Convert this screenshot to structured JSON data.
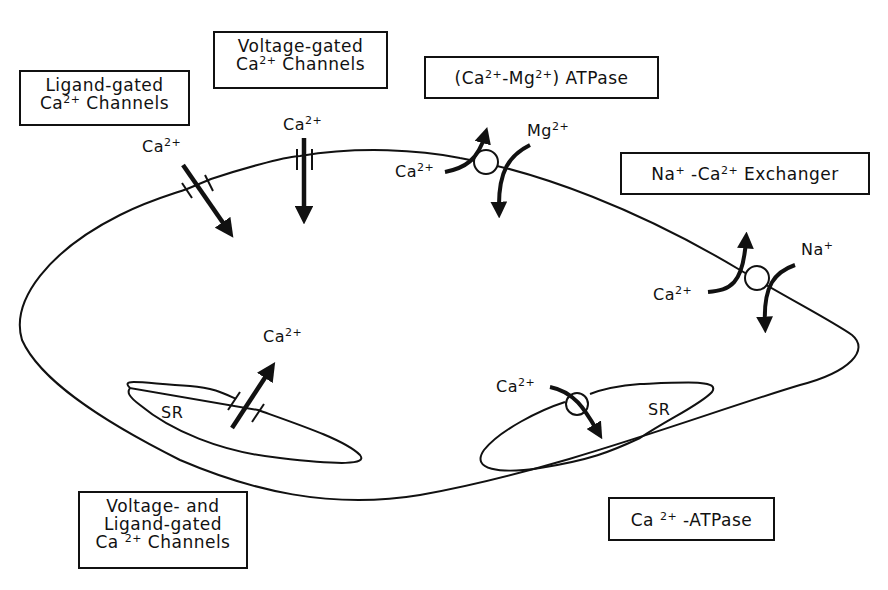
{
  "diagram": {
    "colors": {
      "stroke": "#111111",
      "background": "#ffffff"
    },
    "compartments": {
      "cell": {
        "name": "cell-membrane"
      },
      "sr_left": {
        "label": "SR"
      },
      "sr_right": {
        "label": "SR"
      }
    },
    "labels": {
      "ligand_gated": {
        "line1": "Ligand-gated",
        "line2_base": "Ca",
        "line2_sup": "2+",
        "line2_rest": " Channels"
      },
      "voltage_gated": {
        "line1": "Voltage-gated",
        "line2_base": "Ca",
        "line2_sup": "2+",
        "line2_rest": " Channels"
      },
      "ca_mg_atpase": {
        "open": "(Ca",
        "sup1": "2+",
        "mid": "-Mg",
        "sup2": "2+",
        "close": ")  ATPase"
      },
      "na_ca_exchanger": {
        "na": "Na",
        "sup1": "+",
        "mid": " -Ca",
        "sup2": "2+",
        "rest": "  Exchanger"
      },
      "voltage_ligand": {
        "line1": "Voltage-  and",
        "line2": "Ligand-gated",
        "line3_base": "Ca ",
        "line3_sup": "2+",
        "line3_rest": " Channels"
      },
      "ca_atpase": {
        "base": "Ca ",
        "sup": "2+",
        "rest": " -ATPase"
      }
    },
    "ions": {
      "ligand_ca": {
        "base": "Ca",
        "sup": "2+"
      },
      "voltage_ca": {
        "base": "Ca",
        "sup": "2+"
      },
      "atpase_ca": {
        "base": "Ca",
        "sup": "2+"
      },
      "atpase_mg": {
        "base": "Mg",
        "sup": "2+"
      },
      "exchanger_ca": {
        "base": "Ca",
        "sup": "2+"
      },
      "exchanger_na": {
        "base": "Na",
        "sup": "+"
      },
      "sr_release_ca": {
        "base": "Ca",
        "sup": "2+"
      },
      "sr_uptake_ca": {
        "base": "Ca",
        "sup": "2+"
      }
    }
  }
}
